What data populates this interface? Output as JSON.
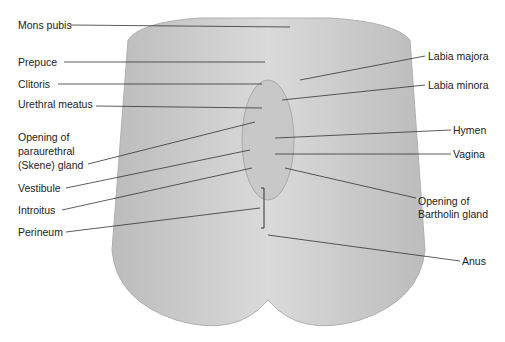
{
  "figure": {
    "type": "anatomical-diagram",
    "colors": {
      "silhouette": "#d4d4d4",
      "silhouette_shade": "#bcbcbc",
      "leader_line": "#333333",
      "text": "#222222",
      "background": "#ffffff"
    }
  },
  "labels_left": [
    {
      "text": "Mons pubis",
      "x": 18,
      "y": 19,
      "line": [
        70,
        25,
        290,
        27
      ]
    },
    {
      "text": "Prepuce",
      "x": 18,
      "y": 56,
      "line": [
        64,
        62,
        265,
        62
      ]
    },
    {
      "text": "Clitoris",
      "x": 18,
      "y": 78,
      "line": [
        58,
        84,
        262,
        84
      ]
    },
    {
      "text": "Urethral meatus",
      "x": 18,
      "y": 98,
      "line": [
        96,
        106,
        262,
        108
      ]
    },
    {
      "text": "Opening of",
      "x": 18,
      "y": 131
    },
    {
      "text": "paraurethral",
      "x": 18,
      "y": 145
    },
    {
      "text": "(Skene) gland",
      "x": 18,
      "y": 159,
      "line": [
        88,
        164,
        255,
        122
      ]
    },
    {
      "text": "Vestibule",
      "x": 18,
      "y": 182,
      "line": [
        66,
        188,
        250,
        150
      ]
    },
    {
      "text": "Introitus",
      "x": 18,
      "y": 204,
      "line": [
        62,
        210,
        252,
        168
      ]
    },
    {
      "text": "Perineum",
      "x": 18,
      "y": 226,
      "line": [
        66,
        232,
        260,
        208
      ]
    }
  ],
  "labels_right": [
    {
      "text": "Labia majora",
      "x": 428,
      "y": 50,
      "line": [
        425,
        56,
        300,
        80
      ]
    },
    {
      "text": "Labia minora",
      "x": 428,
      "y": 79,
      "line": [
        425,
        85,
        282,
        100
      ]
    },
    {
      "text": "Hymen",
      "x": 453,
      "y": 124,
      "line": [
        451,
        130,
        275,
        138
      ]
    },
    {
      "text": "Vagina",
      "x": 453,
      "y": 148,
      "line": [
        451,
        154,
        275,
        154
      ]
    },
    {
      "text": "Opening of",
      "x": 418,
      "y": 195
    },
    {
      "text": "Bartholin gland",
      "x": 418,
      "y": 208,
      "line": [
        416,
        198,
        285,
        168
      ]
    },
    {
      "text": "Anus",
      "x": 462,
      "y": 255,
      "line": [
        460,
        261,
        268,
        235
      ]
    }
  ],
  "bracket": {
    "x": 264,
    "y1": 188,
    "y2": 228
  }
}
